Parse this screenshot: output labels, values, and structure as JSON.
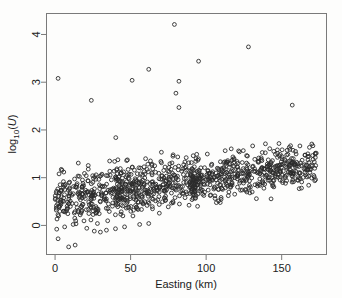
{
  "chart_data": {
    "type": "scatter",
    "title": "",
    "xlabel": "Easting (km)",
    "ylabel": "log10(U)",
    "ylabel_parts": {
      "base": "log",
      "sub": "10",
      "paren_open": "(",
      "var": "U",
      "paren_close": ")"
    },
    "xlim": [
      -6,
      180
    ],
    "ylim": [
      -0.62,
      4.45
    ],
    "xticks": [
      0,
      50,
      100,
      150
    ],
    "xticklabels": [
      "0",
      "50",
      "100",
      "150"
    ],
    "yticks": [
      0,
      1,
      2,
      3,
      4
    ],
    "yticklabels": [
      "0",
      "1",
      "2",
      "3",
      "4"
    ],
    "grid": false,
    "legend": null,
    "marker": {
      "shape": "open-circle",
      "radius_px": 1.9,
      "color": "#2b2b2b",
      "fill": "none"
    },
    "axis_color": "#7a7a7a",
    "background": "#ffffff",
    "n_points": 1080,
    "trend": {
      "intercept": 0.55,
      "slope_per_km": 0.0042,
      "spread_sd": 0.26
    },
    "outliers_high": [
      [
        2,
        3.08
      ],
      [
        24,
        2.62
      ],
      [
        51,
        3.04
      ],
      [
        62,
        3.27
      ],
      [
        79,
        4.21
      ],
      [
        82,
        3.02
      ],
      [
        80,
        2.77
      ],
      [
        82,
        2.47
      ],
      [
        95,
        3.44
      ],
      [
        128,
        3.74
      ],
      [
        157,
        2.52
      ]
    ],
    "outliers_low": [
      [
        2,
        -0.28
      ],
      [
        9,
        -0.45
      ],
      [
        12,
        0.02
      ],
      [
        21,
        -0.06
      ],
      [
        30,
        -0.14
      ],
      [
        34,
        -0.1
      ],
      [
        40,
        -0.07
      ],
      [
        46,
        -0.03
      ],
      [
        56,
        0.02
      ],
      [
        62,
        0.04
      ]
    ],
    "series": [
      {
        "name": "observations",
        "x": [],
        "y": []
      }
    ]
  },
  "axes": {
    "plot_box": {
      "left": 46,
      "top": 13,
      "right": 327,
      "bottom": 255
    }
  }
}
